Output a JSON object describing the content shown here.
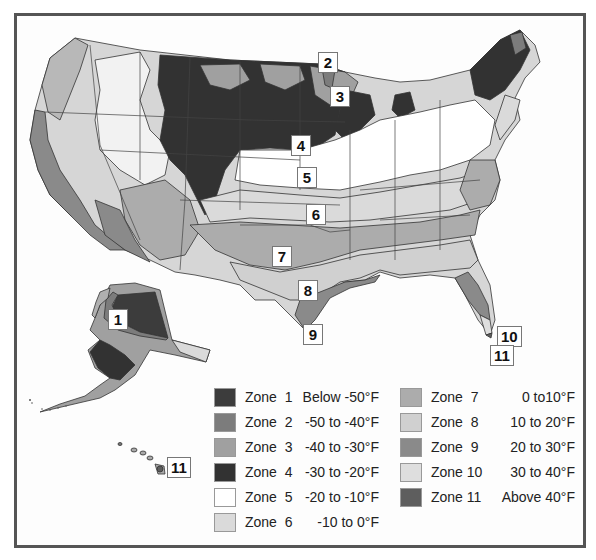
{
  "map": {
    "title": "USDA Plant Hardiness Zone Map",
    "region": "United States including Alaska and Hawaii",
    "zone_labels": [
      {
        "id": "1",
        "text": "1",
        "x": 108,
        "y": 309
      },
      {
        "id": "2",
        "text": "2",
        "x": 318,
        "y": 52
      },
      {
        "id": "3",
        "text": "3",
        "x": 330,
        "y": 86
      },
      {
        "id": "4",
        "text": "4",
        "x": 291,
        "y": 135
      },
      {
        "id": "5",
        "text": "5",
        "x": 297,
        "y": 167
      },
      {
        "id": "6",
        "text": "6",
        "x": 306,
        "y": 204
      },
      {
        "id": "7",
        "text": "7",
        "x": 272,
        "y": 246
      },
      {
        "id": "8",
        "text": "8",
        "x": 298,
        "y": 280
      },
      {
        "id": "9",
        "text": "9",
        "x": 303,
        "y": 324
      },
      {
        "id": "10",
        "text": "10",
        "x": 497,
        "y": 326
      },
      {
        "id": "11a",
        "text": "11",
        "x": 490,
        "y": 345
      },
      {
        "id": "11b",
        "text": "11",
        "x": 167,
        "y": 457
      }
    ]
  },
  "legend": {
    "items": [
      {
        "zone": "Zone  1",
        "range": "Below -50°F",
        "color": "#3c3c3c"
      },
      {
        "zone": "Zone  2",
        "range": "-50 to -40°F",
        "color": "#7c7c7c"
      },
      {
        "zone": "Zone  3",
        "range": "-40 to -30°F",
        "color": "#a0a0a0"
      },
      {
        "zone": "Zone  4",
        "range": "-30 to -20°F",
        "color": "#323232"
      },
      {
        "zone": "Zone  5",
        "range": "-20 to -10°F",
        "color": "#ffffff"
      },
      {
        "zone": "Zone  6",
        "range": "-10 to 0°F",
        "color": "#dadada"
      },
      {
        "zone": "Zone  7",
        "range": "0 to10°F",
        "color": "#acacac"
      },
      {
        "zone": "Zone  8",
        "range": "10 to 20°F",
        "color": "#d0d0d0"
      },
      {
        "zone": "Zone  9",
        "range": "20 to 30°F",
        "color": "#8a8a8a"
      },
      {
        "zone": "Zone 10",
        "range": "30 to 40°F",
        "color": "#dedede"
      },
      {
        "zone": "Zone 11",
        "range": "Above 40°F",
        "color": "#5e5e5e"
      }
    ]
  },
  "chart_data": {
    "type": "heatmap",
    "categories": [
      "Zone 1",
      "Zone 2",
      "Zone 3",
      "Zone 4",
      "Zone 5",
      "Zone 6",
      "Zone 7",
      "Zone 8",
      "Zone 9",
      "Zone 10",
      "Zone 11"
    ],
    "values": [
      "Below -50°F",
      "-50 to -40°F",
      "-40 to -30°F",
      "-30 to -20°F",
      "-20 to -10°F",
      "-10 to 0°F",
      "0 to10°F",
      "10 to 20°F",
      "20 to 30°F",
      "30 to 40°F",
      "Above 40°F"
    ],
    "legend_position": "bottom-right"
  }
}
